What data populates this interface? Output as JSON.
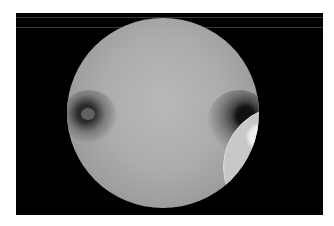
{
  "image": {
    "description": "Circular grayscale microscope field of view on black background",
    "features": [
      {
        "name": "left-ring-artifact",
        "type": "dark ring"
      },
      {
        "name": "right-ring-artifact",
        "type": "dark ring"
      },
      {
        "name": "bright-textured-patch",
        "type": "bright cellular region, lower right"
      }
    ],
    "colors": {
      "background": "#ffffff",
      "frame": "#000000",
      "field": "#acacac"
    }
  }
}
